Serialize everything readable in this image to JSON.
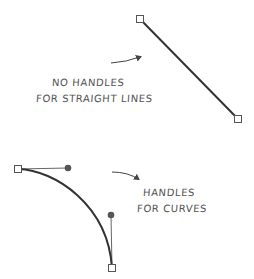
{
  "colors": {
    "line": "#333333",
    "handle_line": "#666666",
    "handle_dot": "#555555",
    "anchor_fill": "#ffffff",
    "anchor_stroke": "#555555",
    "arrow": "#444444",
    "text": "#555555",
    "background": "#ffffff"
  },
  "straight": {
    "anchors": [
      {
        "x": 140,
        "y": 19
      },
      {
        "x": 238,
        "y": 119
      }
    ],
    "label_line1": "NO HANDLES",
    "label_line2": "FOR STRAIGHT LINES",
    "arrow": {
      "from": {
        "x": 111,
        "y": 63
      },
      "to": {
        "x": 142,
        "y": 56
      }
    }
  },
  "curve": {
    "anchors": [
      {
        "x": 18,
        "y": 169
      },
      {
        "x": 112,
        "y": 268
      }
    ],
    "handles": [
      {
        "x": 68,
        "y": 168
      },
      {
        "x": 111,
        "y": 215
      }
    ],
    "label_line1": "HANDLES",
    "label_line2": "FOR CURVES",
    "arrow": {
      "from": {
        "x": 112,
        "y": 172
      },
      "to": {
        "x": 140,
        "y": 180
      }
    }
  }
}
